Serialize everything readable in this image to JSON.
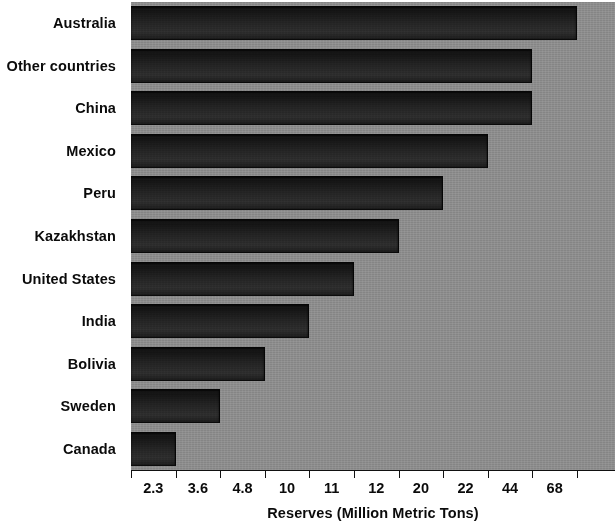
{
  "chart_data": {
    "type": "bar",
    "orientation": "horizontal",
    "title": "",
    "subtitle": "",
    "xlabel": "Reserves (Million Metric Tons)",
    "ylabel": "",
    "grid": false,
    "legend": null,
    "legend_position": "none",
    "axis_scale": "categorical-ordinal",
    "note": "X axis tick labels are the bar values themselves, placed at evenly spaced ordinal positions (not a linear numeric scale).",
    "xticklabels": [
      "2.3",
      "3.6",
      "4.8",
      "10",
      "11",
      "12",
      "20",
      "22",
      "44",
      "68"
    ],
    "xtick_ordinals": [
      1,
      2,
      3,
      4,
      5,
      6,
      7,
      8,
      9,
      10
    ],
    "categories": [
      "Australia",
      "Other countries",
      "China",
      "Mexico",
      "Peru",
      "Kazakhstan",
      "United States",
      "India",
      "Bolivia",
      "Sweden",
      "Canada"
    ],
    "values": [
      68,
      44,
      44,
      22,
      20,
      12,
      11,
      10,
      4.8,
      3.6,
      2.3
    ],
    "bar_ordinals": [
      10,
      9,
      9,
      8,
      7,
      6,
      5,
      4,
      3,
      2,
      1
    ],
    "colors": {
      "plot_background": "#8d8d8d",
      "figure_background": "#ffffff",
      "bar_fill": "#232323",
      "bar_edge": "#050505",
      "text": "#0b0b0b",
      "axis": "#111111"
    }
  }
}
